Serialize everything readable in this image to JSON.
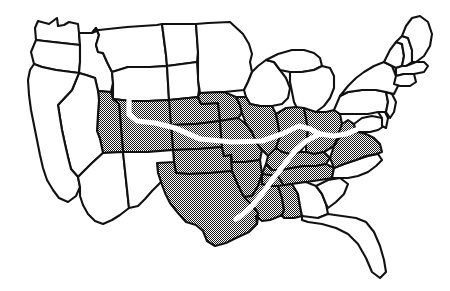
{
  "figure": {
    "name": "united-states-map",
    "type": "map",
    "width": 450,
    "height": 291,
    "background_color": "#ffffff",
    "outline_color": "#111111",
    "shaded_fill_color": "#999999",
    "shaded_fill_style": "halftone-dither",
    "plain_fill_color": "#ffffff",
    "route_color": "#ffffff"
  },
  "legend_semantics": {
    "shaded_meaning": "highlighted-states",
    "plain_meaning": "non-highlighted-states",
    "route_meaning": "white-route-line"
  },
  "states": [
    {
      "name": "washington",
      "shaded": false,
      "points": "35,28 38,21 49,24 57,18 58,26 64,25 69,22 78,24 79,33 80,45 62,43 44,41 36,40"
    },
    {
      "name": "oregon",
      "shaded": false,
      "points": "36,40 44,41 62,43 80,45 80,62 79,73 56,70 42,67 34,64 31,52"
    },
    {
      "name": "idaho",
      "shaded": false,
      "points": "80,45 79,33 92,33 96,28 99,35 96,45 98,52 103,53 107,62 112,72 113,83 111,92 98,91 95,78 86,75 79,73 80,62"
    },
    {
      "name": "montana",
      "shaded": false,
      "points": "92,33 99,30 127,27 157,25 162,24 166,55 167,66 150,67 128,67 112,72 107,62 103,53 98,52 96,45 99,35 96,28"
    },
    {
      "name": "wyoming",
      "shaded": false,
      "points": "112,72 128,67 150,67 167,66 169,100 148,101 131,101 113,99 113,83"
    },
    {
      "name": "north-dakota",
      "shaded": false,
      "points": "162,24 196,24 198,52 197,62 167,66 166,55"
    },
    {
      "name": "south-dakota",
      "shaded": false,
      "points": "167,66 197,62 199,90 198,97 169,100 167,66"
    },
    {
      "name": "nebraska",
      "shaded": true,
      "points": "169,100 198,97 201,104 218,103 220,121 196,124 171,125 169,112"
    },
    {
      "name": "kansas",
      "shaded": true,
      "points": "171,125 196,124 220,121 222,147 198,149 173,150"
    },
    {
      "name": "oklahoma",
      "shaded": true,
      "points": "173,150 198,149 222,147 224,156 231,155 232,171 210,173 189,174 176,173 174,162"
    },
    {
      "name": "texas",
      "shaded": true,
      "points": "174,162 176,173 189,174 210,173 232,171 238,185 244,197 252,205 258,213 257,224 249,232 236,238 226,243 215,246 207,241 203,231 196,225 186,222 178,213 170,203 165,193 161,182 158,173 157,163 160,161"
    },
    {
      "name": "colorado",
      "shaded": true,
      "points": "113,99 131,101 148,101 169,100 171,125 173,150 148,152 123,152 121,128 119,104"
    },
    {
      "name": "utah",
      "shaded": true,
      "points": "111,92 113,99 119,104 121,128 123,152 103,153 100,139 97,131 98,114 99,100 98,91"
    },
    {
      "name": "nevada",
      "shaded": false,
      "points": "79,73 86,75 95,78 98,91 99,100 98,114 97,131 100,139 103,153 92,163 85,170 78,177 71,169 68,157 65,144 62,130 60,118 58,105 72,90"
    },
    {
      "name": "california",
      "shaded": false,
      "points": "34,64 42,67 56,70 79,73 72,90 58,105 60,118 62,130 65,144 68,157 71,169 78,177 80,187 76,196 68,202 59,198 53,190 47,180 43,168 40,155 37,140 34,125 31,110 29,95 28,80 30,70"
    },
    {
      "name": "arizona",
      "shaded": false,
      "points": "103,153 123,152 126,180 129,208 120,215 112,220 103,224 95,221 88,214 83,205 80,196 80,187 78,177 85,170 92,163"
    },
    {
      "name": "new-mexico",
      "shaded": false,
      "points": "123,152 148,152 173,150 174,162 157,163 158,173 161,182 152,191 145,199 138,206 129,208 126,180"
    },
    {
      "name": "minnesota",
      "shaded": false,
      "points": "196,24 208,23 230,22 243,34 249,44 252,54 250,62 252,72 248,82 244,90 224,92 200,93 198,80 198,52"
    },
    {
      "name": "iowa",
      "shaded": true,
      "points": "198,97 200,93 224,92 236,97 240,105 242,113 238,118 220,121 218,103 201,104"
    },
    {
      "name": "missouri",
      "shaded": true,
      "points": "220,121 238,118 246,124 252,132 256,142 262,150 260,160 245,162 232,162 231,155 224,156 222,147"
    },
    {
      "name": "arkansas",
      "shaded": true,
      "points": "231,155 232,162 245,162 260,160 262,174 258,186 252,196 244,197 238,185 232,171"
    },
    {
      "name": "louisiana",
      "shaded": true,
      "points": "244,197 252,196 258,186 262,174 278,176 284,186 290,196 288,208 280,216 270,220 262,221 256,216 257,224 258,213 252,205"
    },
    {
      "name": "wisconsin",
      "shaded": false,
      "points": "244,90 248,82 252,72 258,66 266,60 274,62 280,70 286,78 290,88 288,98 282,104 272,106 260,106 250,104 246,97"
    },
    {
      "name": "illinois",
      "shaded": true,
      "points": "246,97 250,104 260,106 272,106 276,114 278,124 280,136 276,148 268,156 262,150 256,142 252,132 246,124 242,113 240,105 236,97"
    },
    {
      "name": "michigan-upper",
      "shaded": false,
      "points": "266,60 278,54 292,50 304,50 314,53 320,58 322,66 314,70 302,72 290,72 280,70 274,62"
    },
    {
      "name": "michigan-lower",
      "shaded": false,
      "points": "290,72 302,72 314,70 322,66 330,68 334,76 334,88 330,98 324,106 316,112 306,114 298,110 294,102 292,92 290,82"
    },
    {
      "name": "indiana",
      "shaded": true,
      "points": "280,136 278,124 276,114 286,108 296,107 304,108 306,118 308,130 306,144 300,152 290,154 282,152 276,148"
    },
    {
      "name": "ohio",
      "shaded": true,
      "points": "304,108 316,112 326,112 334,110 340,114 342,124 340,136 334,146 324,152 314,154 306,152 306,144 308,130 306,118"
    },
    {
      "name": "kentucky",
      "shaded": true,
      "points": "268,156 276,148 282,152 290,154 300,152 306,152 314,154 324,152 330,158 326,164 316,166 304,166 292,168 282,170 272,170 266,164"
    },
    {
      "name": "tennessee",
      "shaded": true,
      "points": "262,174 266,164 272,170 282,170 292,168 304,166 316,166 326,164 334,168 332,178 320,180 306,182 292,184 278,186 270,186 262,184"
    },
    {
      "name": "mississippi",
      "shaded": true,
      "points": "262,174 262,184 270,186 278,186 282,198 284,210 282,216 280,216 288,208 290,196 284,186 278,176"
    },
    {
      "name": "alabama",
      "shaded": true,
      "points": "278,186 292,184 298,194 300,206 302,216 294,218 284,218 282,216 284,210 282,198"
    },
    {
      "name": "georgia",
      "shaded": false,
      "points": "292,184 306,182 316,186 322,194 326,204 328,214 318,218 306,218 302,216 300,206 298,194"
    },
    {
      "name": "florida",
      "shaded": false,
      "points": "302,216 318,218 328,214 342,216 356,218 366,222 374,232 380,246 384,260 386,272 380,278 372,272 366,258 358,244 348,234 336,228 322,224 308,222 302,220"
    },
    {
      "name": "south-carolina",
      "shaded": false,
      "points": "316,186 328,180 340,178 348,184 344,194 336,202 328,208 326,204 322,194"
    },
    {
      "name": "north-carolina",
      "shaded": false,
      "points": "332,178 334,168 344,164 356,160 368,156 378,154 382,160 376,166 368,172 358,176 348,178 340,178"
    },
    {
      "name": "virginia",
      "shaded": true,
      "points": "330,158 334,146 340,136 348,134 358,132 366,134 374,138 380,144 382,152 376,154 366,156 356,160 344,164 334,168"
    },
    {
      "name": "west-virginia",
      "shaded": true,
      "points": "334,146 342,124 348,120 354,124 356,132 348,134 340,136"
    },
    {
      "name": "maryland",
      "shaded": false,
      "points": "354,124 362,118 372,116 382,118 384,126 378,130 370,132 362,132 356,132"
    },
    {
      "name": "delaware",
      "shaded": false,
      "points": "378,112 384,110 388,118 386,128 382,126 382,118"
    },
    {
      "name": "pennsylvania",
      "shaded": false,
      "points": "334,110 340,96 348,92 362,90 376,90 386,92 388,102 386,112 378,112 368,114 356,114 346,114 340,114"
    },
    {
      "name": "new-jersey",
      "shaded": false,
      "points": "386,92 392,94 396,102 394,112 390,118 386,112 388,102"
    },
    {
      "name": "new-york",
      "shaded": false,
      "points": "340,96 348,86 356,78 364,72 374,66 384,62 392,66 396,76 398,86 394,94 386,92 376,90 362,90 348,92"
    },
    {
      "name": "vermont",
      "shaded": false,
      "points": "384,62 390,50 396,42 402,44 404,56 402,66 396,68 392,66"
    },
    {
      "name": "new-hampshire",
      "shaded": false,
      "points": "396,42 402,36 408,38 412,50 412,62 406,66 402,66 404,56 402,44"
    },
    {
      "name": "maine",
      "shaded": false,
      "points": "402,36 406,26 412,18 420,16 428,22 432,34 430,46 424,56 416,62 412,62 412,50 408,38"
    },
    {
      "name": "massachusetts",
      "shaded": false,
      "points": "396,68 402,66 406,66 416,62 424,62 428,66 424,72 414,74 404,74 396,76"
    },
    {
      "name": "connecticut-rhode-island",
      "shaded": false,
      "points": "396,76 404,74 414,74 416,82 410,86 400,86 394,84"
    }
  ],
  "route": {
    "name": "white-route-line",
    "segments": [
      {
        "name": "route-segment-west-to-junction",
        "path": "M 129,100 L 129,114 L 137,121 L 155,123 L 175,128 L 200,139 L 232,142 L 262,141 L 282,134 L 299,126 L 310,129 L 320,134"
      },
      {
        "name": "route-segment-junction-to-northeast",
        "path": "M 320,134 L 334,136 L 346,134 L 356,130"
      },
      {
        "name": "route-segment-junction-to-southwest",
        "path": "M 320,134 L 306,141 L 294,152 L 283,166 L 272,180 L 262,194 L 252,206 L 242,215 L 236,219"
      }
    ]
  }
}
